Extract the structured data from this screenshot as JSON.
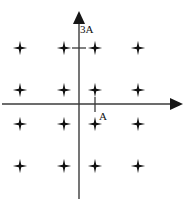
{
  "figure": {
    "background_color": "#ffffff",
    "line_color": "#3b3b3b",
    "marker_color": "#111111"
  },
  "axes": {
    "x_axis": {
      "name": "horizontal-axis",
      "y_pixel": 104,
      "x_start": 2,
      "x_end": 182,
      "arrow": "right",
      "tick": {
        "label": "A",
        "x_pixel": 95,
        "label_x_pixel": 98,
        "label_y_pixel": 118
      }
    },
    "y_axis": {
      "name": "vertical-axis",
      "x_pixel": 79,
      "y_start": 198,
      "y_end": 12,
      "arrow": "up",
      "tick": {
        "label": "3A",
        "y_pixel": 48,
        "label_x_pixel": 82,
        "label_y_pixel": 32
      }
    }
  },
  "chart_data": {
    "type": "scatter",
    "xlabel": "",
    "ylabel": "",
    "marker": "four-pointed-star",
    "grid": false,
    "legend": null,
    "axis_unit": "A",
    "x_tick_labels": [
      "A"
    ],
    "y_tick_labels": [
      "3A"
    ],
    "xlim": [
      -3,
      3
    ],
    "ylim": [
      -3,
      3
    ],
    "x_levels": [
      -3,
      -1,
      1,
      3
    ],
    "y_levels": [
      -3,
      -1,
      1,
      3
    ],
    "point_count": 16,
    "points": [
      {
        "x": -3,
        "y": 3,
        "px": 20,
        "py": 48
      },
      {
        "x": -1,
        "y": 3,
        "px": 64,
        "py": 48
      },
      {
        "x": 1,
        "y": 3,
        "px": 95,
        "py": 48
      },
      {
        "x": 3,
        "y": 3,
        "px": 138,
        "py": 48
      },
      {
        "x": -3,
        "y": 1,
        "px": 20,
        "py": 90
      },
      {
        "x": -1,
        "y": 1,
        "px": 64,
        "py": 90
      },
      {
        "x": 1,
        "y": 1,
        "px": 95,
        "py": 90
      },
      {
        "x": 3,
        "y": 1,
        "px": 138,
        "py": 90
      },
      {
        "x": -3,
        "y": -1,
        "px": 20,
        "py": 124
      },
      {
        "x": -1,
        "y": -1,
        "px": 64,
        "py": 124
      },
      {
        "x": 1,
        "y": -1,
        "px": 95,
        "py": 124
      },
      {
        "x": 3,
        "y": -1,
        "px": 138,
        "py": 124
      },
      {
        "x": -3,
        "y": -3,
        "px": 20,
        "py": 166
      },
      {
        "x": -1,
        "y": -3,
        "px": 64,
        "py": 166
      },
      {
        "x": 1,
        "y": -3,
        "px": 95,
        "py": 166
      },
      {
        "x": 3,
        "y": -3,
        "px": 138,
        "py": 166
      }
    ]
  }
}
